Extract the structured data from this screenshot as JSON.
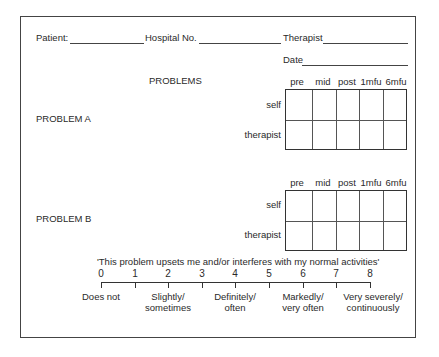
{
  "header": {
    "patient_label": "Patient:",
    "hospital_label": "Hospital No.",
    "therapist_label": "Therapist",
    "date_label": "Date"
  },
  "problems_heading": "PROBLEMS",
  "columns": [
    "pre",
    "mid",
    "post",
    "1mfu",
    "6mfu"
  ],
  "rows": [
    "self",
    "therapist"
  ],
  "problems": [
    {
      "label": "PROBLEM A"
    },
    {
      "label": "PROBLEM B"
    }
  ],
  "scale": {
    "prompt": "'This problem upsets me and/or interferes with my normal activities'",
    "ticks": [
      "0",
      "1",
      "2",
      "3",
      "4",
      "5",
      "6",
      "7",
      "8"
    ],
    "anchors": [
      {
        "line1": "Does not",
        "line2": ""
      },
      {
        "line1": "Slightly/",
        "line2": "sometimes"
      },
      {
        "line1": "Definitely/",
        "line2": "often"
      },
      {
        "line1": "Markedly/",
        "line2": "very often"
      },
      {
        "line1": "Very severely/",
        "line2": "continuously"
      }
    ]
  }
}
